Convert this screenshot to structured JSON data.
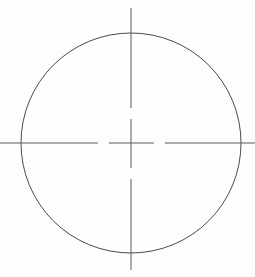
{
  "document": {
    "title": "Circle with Centerlines",
    "type": "technical-line-drawing"
  },
  "canvas": {
    "width": 255,
    "height": 277,
    "background_color": "#fdfdfd"
  },
  "drawing": {
    "stroke_color": "#4a4a4a",
    "centerline_color": "#5a5a5a",
    "circle": {
      "label": "construction-circle",
      "center_x": 131,
      "center_y": 143,
      "radius": 110,
      "stroke_width": 1,
      "bounds": {
        "left": 21,
        "right": 241,
        "top": 33,
        "bottom": 253
      }
    },
    "horizontal_centerline": {
      "label": "horizontal-centerline",
      "y": 143,
      "x_start": 0,
      "x_end": 255,
      "stroke_width": 1,
      "segments": [
        {
          "from": 0,
          "to": 98
        },
        {
          "from": 109,
          "to": 154
        },
        {
          "from": 165,
          "to": 255
        }
      ]
    },
    "vertical_centerline": {
      "label": "vertical-centerline",
      "x": 131,
      "y_start": 8,
      "y_end": 270,
      "stroke_width": 1,
      "segments": [
        {
          "from": 8,
          "to": 108
        },
        {
          "from": 119,
          "to": 168
        },
        {
          "from": 179,
          "to": 270
        }
      ]
    },
    "center_mark": {
      "label": "center-mark",
      "x": 131,
      "y": 143,
      "arm_length": 23
    }
  }
}
